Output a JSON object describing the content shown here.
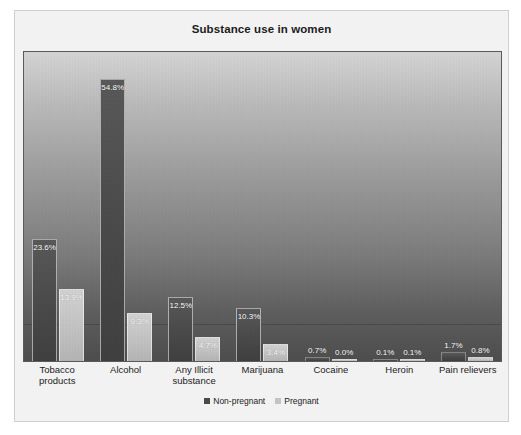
{
  "chart_data": {
    "type": "bar",
    "title": "Substance use in women",
    "xlabel": "",
    "ylabel": "",
    "ylim": [
      0,
      60
    ],
    "grid": false,
    "legend_position": "bottom",
    "categories": [
      "Tobacco products",
      "Alcohol",
      "Any Illicit substance",
      "Marijuana",
      "Cocaine",
      "Heroin",
      "Pain relievers"
    ],
    "series": [
      {
        "name": "Non-pregnant",
        "color": "#4a4a4a",
        "values": [
          23.6,
          54.8,
          12.5,
          10.3,
          0.7,
          0.1,
          1.7
        ],
        "labels": [
          "23.6%",
          "54.8%",
          "12.5%",
          "10.3%",
          "0.7%",
          "0.1%",
          "1.7%"
        ]
      },
      {
        "name": "Pregnant",
        "color": "#c3c3c3",
        "values": [
          13.9,
          9.3,
          4.7,
          3.4,
          0.0,
          0.1,
          0.8
        ],
        "labels": [
          "13.9%",
          "9.3%",
          "4.7%",
          "3.4%",
          "0.0%",
          "0.1%",
          "0.8%"
        ]
      }
    ]
  },
  "categories_display": [
    "Tobacco\nproducts",
    "Alcohol",
    "Any Illicit\nsubstance",
    "Marijuana",
    "Cocaine",
    "Heroin",
    "Pain relievers"
  ],
  "legend": {
    "items": [
      {
        "label": "Non-pregnant",
        "swatch": "dark"
      },
      {
        "label": "Pregnant",
        "swatch": "light"
      }
    ]
  }
}
